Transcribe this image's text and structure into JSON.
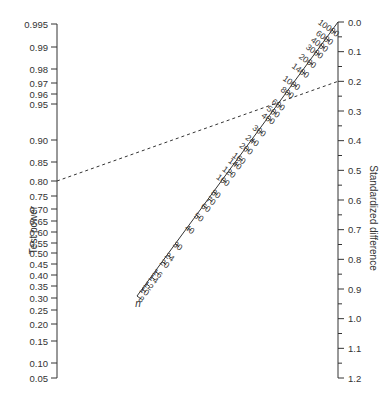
{
  "chart_data": {
    "type": "nomogram",
    "title": "",
    "axes": {
      "left": {
        "label": "Test power",
        "ticks": [
          "0.995",
          "0.99",
          "0.98",
          "0.97",
          "0.96",
          "0.95",
          "0.90",
          "0.85",
          "0.80",
          "0.75",
          "0.70",
          "0.65",
          "0.60",
          "0.55",
          "0.50",
          "0.45",
          "0.40",
          "0.35",
          "0.30",
          "0.25",
          "0.20",
          "0.15",
          "0.10",
          "0.05"
        ],
        "tick_y": [
          24,
          47,
          69,
          83,
          94,
          104,
          140,
          162,
          181,
          196,
          209,
          221,
          232,
          243,
          253,
          264,
          275,
          286,
          298,
          310,
          324,
          341,
          363,
          378
        ]
      },
      "right": {
        "label": "Standardized difference",
        "ticks": [
          "0.0",
          "0.1",
          "0.2",
          "0.3",
          "0.4",
          "0.5",
          "0.6",
          "0.7",
          "0.8",
          "0.9",
          "1.0",
          "1.1",
          "1.2"
        ],
        "range": [
          0.0,
          1.2
        ],
        "minor_ticks": true
      },
      "diagonal": {
        "label": "n",
        "ticks": [
          "10000",
          "6000",
          "4000",
          "3000",
          "2000",
          "1400",
          "1000",
          "800",
          "600",
          "500",
          "400",
          "300",
          "240",
          "200",
          "160",
          "140",
          "120",
          "100",
          "80",
          "70",
          "60",
          "50",
          "40",
          "30",
          "24",
          "20",
          "16",
          "14",
          "12",
          "10",
          "8"
        ],
        "tick_t": [
          0.03,
          0.06,
          0.085,
          0.11,
          0.145,
          0.18,
          0.225,
          0.255,
          0.3,
          0.325,
          0.35,
          0.395,
          0.43,
          0.46,
          0.495,
          0.515,
          0.545,
          0.575,
          0.62,
          0.645,
          0.67,
          0.705,
          0.75,
          0.81,
          0.85,
          0.875,
          0.91,
          0.93,
          0.955,
          0.975,
          1.0
        ]
      }
    },
    "example_line": {
      "style": "dashed",
      "from": {
        "axis": "Test power",
        "value": 0.8
      },
      "to": {
        "axis": "Standardized difference",
        "value": 0.2
      },
      "crosses_n_at": 600
    }
  }
}
